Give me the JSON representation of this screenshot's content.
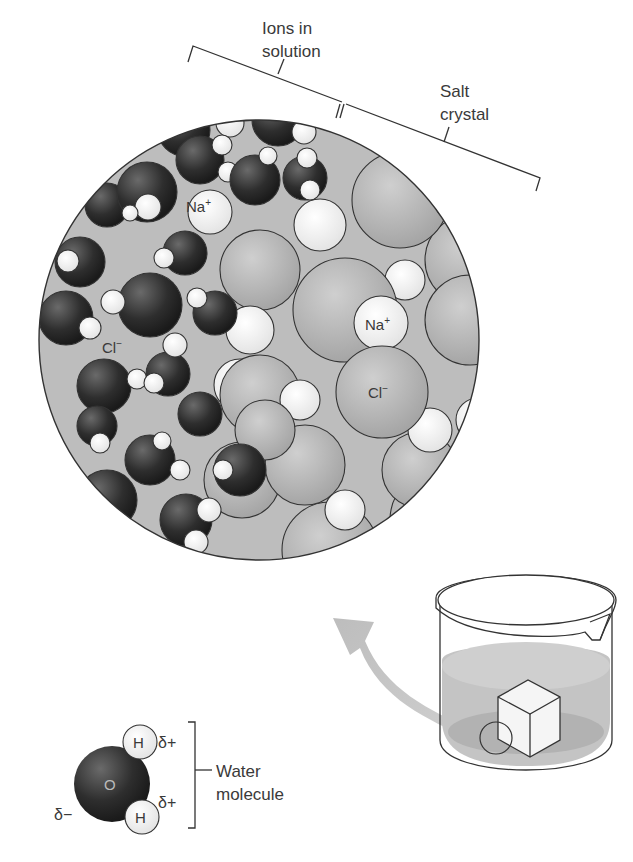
{
  "labels": {
    "ions_line1": "Ions in",
    "ions_line2": "solution",
    "salt_line1": "Salt",
    "salt_line2": "crystal",
    "na_solution": "Na",
    "na_solution_sup": "+",
    "cl_solution": "Cl",
    "cl_solution_sup": "−",
    "na_crystal": "Na",
    "na_crystal_sup": "+",
    "cl_crystal": "Cl",
    "cl_crystal_sup": "−"
  },
  "water_molecule": {
    "oxygen": "O",
    "hydrogen_top": "H",
    "hydrogen_bottom": "H",
    "delta_plus_top": "δ+",
    "delta_plus_bottom": "δ+",
    "delta_minus": "δ−",
    "label_line1": "Water",
    "label_line2": "molecule"
  },
  "colors": {
    "background": "#ffffff",
    "solution_fill": "#bdbdbd",
    "water_oxygen": "#2e2e2e",
    "hydrogen": "#eeeeee",
    "chloride": "#b0b0b0",
    "sodium": "#f0f0f0",
    "outline": "#333333",
    "arrow": "#c8c8c8",
    "beaker_liquid": "#c4c4c4"
  }
}
